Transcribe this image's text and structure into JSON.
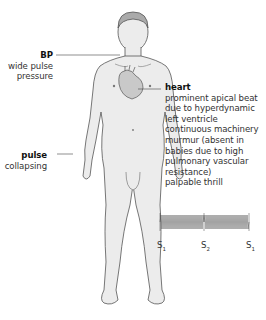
{
  "labels": {
    "bp": {
      "title": "BP",
      "lines": [
        "wide pulse",
        "pressure"
      ]
    },
    "pulse": {
      "title": "pulse",
      "lines": [
        "collapsing"
      ]
    },
    "heart": {
      "title": "heart",
      "lines": [
        "prominent apical beat",
        "due to hyperdynamic",
        "left ventricle",
        "continuous machinery",
        "murmur (absent in",
        "babies due to high",
        "pulmonary vascular",
        "resistance)",
        "palpable thrill"
      ]
    }
  },
  "phonocardiogram": {
    "markers": [
      {
        "label": "S",
        "sub": "1"
      },
      {
        "label": "S",
        "sub": "2"
      },
      {
        "label": "S",
        "sub": "1"
      }
    ]
  },
  "colors": {
    "body_fill": "#ececec",
    "outline": "#555555",
    "heart_fill": "#c9c9c9",
    "leader_line": "#444444"
  }
}
